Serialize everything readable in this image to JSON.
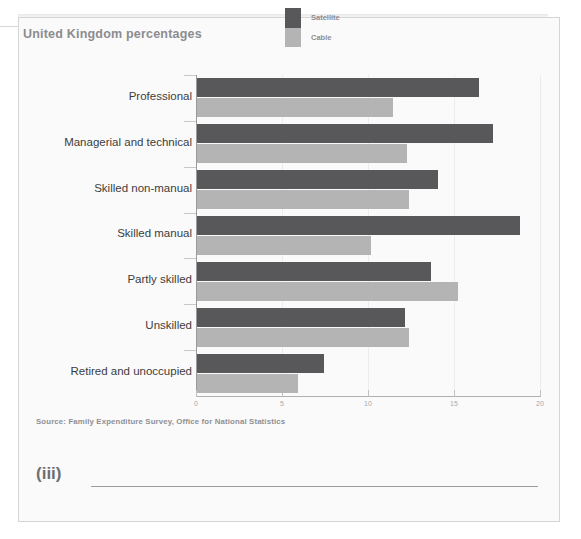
{
  "figure": {
    "title": "United Kingdom percentages",
    "source": "Source: Family Expenditure Survey, Office for National Statistics"
  },
  "legend": {
    "items": [
      {
        "label": "Satellite",
        "color": "#58585a",
        "icon": "legend-swatch-dark"
      },
      {
        "label": "Cable",
        "color": "#b4b4b4",
        "icon": "legend-swatch-light"
      }
    ]
  },
  "question": {
    "number": "(iii)",
    "answer_value": ""
  },
  "chart_data": {
    "type": "bar",
    "orientation": "horizontal",
    "title": "United Kingdom percentages",
    "xlabel": "",
    "ylabel": "",
    "xlim": [
      0,
      20
    ],
    "xticks": [
      0,
      5,
      10,
      15,
      20
    ],
    "xtick_labels": [
      "0",
      "5",
      "10",
      "15",
      "20"
    ],
    "grid": true,
    "legend_position": "top-right",
    "categories": [
      "Professional",
      "Managerial and technical",
      "Skilled non-manual",
      "Skilled manual",
      "Partly skilled",
      "Unskilled",
      "Retired and unoccupied"
    ],
    "series": [
      {
        "name": "Satellite",
        "color": "#58585a",
        "values": [
          16.4,
          17.2,
          14.0,
          18.8,
          13.6,
          12.1,
          7.4
        ]
      },
      {
        "name": "Cable",
        "color": "#b4b4b4",
        "values": [
          11.4,
          12.2,
          12.3,
          10.1,
          15.2,
          12.3,
          5.9
        ]
      }
    ]
  }
}
